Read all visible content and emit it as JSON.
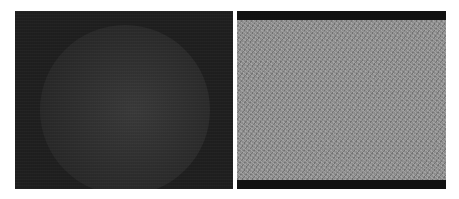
{
  "figure": {
    "panels": [
      {
        "id": "left",
        "description": "dark noisy image with faint circular bright disk",
        "background_color": "#1f1f1f",
        "disk_color": "#353535"
      },
      {
        "id": "right",
        "description": "gray random noise image with black bars top and bottom",
        "background_color": "#8a8a8a",
        "bar_color": "#121212"
      }
    ]
  }
}
